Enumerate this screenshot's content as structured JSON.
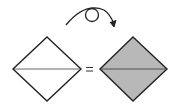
{
  "diagram": {
    "type": "origami-step",
    "instruction_symbol": "turn-over",
    "equals_sign": "=",
    "colors": {
      "background": "#ffffff",
      "stroke": "#222222",
      "crease": "#555555",
      "paper_front": "#ffffff",
      "paper_back": "#b8b8b8"
    },
    "shapes": [
      {
        "name": "before-diamond",
        "fill": "white",
        "has_horizontal_crease": true
      },
      {
        "name": "after-diamond",
        "fill": "gray",
        "has_horizontal_crease": true
      }
    ]
  }
}
